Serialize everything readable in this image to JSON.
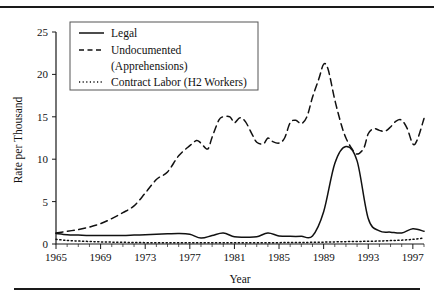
{
  "figure": {
    "has_top_rule": true,
    "has_bottom_rule": true,
    "rule_color": "#1a1a1a",
    "background": "#ffffff"
  },
  "chart_data": {
    "type": "line",
    "title": "",
    "xlabel": "Year",
    "ylabel": "Rate per Thousand",
    "xlim": [
      1965,
      1998
    ],
    "ylim": [
      0,
      25
    ],
    "grid": false,
    "legend_position": "top-left",
    "xticks": [
      1965,
      1969,
      1973,
      1977,
      1981,
      1985,
      1989,
      1993,
      1997
    ],
    "xtick_labels": [
      "1965",
      "1969",
      "1973",
      "1977",
      "1981",
      "1985",
      "1989",
      "1993",
      "1997"
    ],
    "yticks": [
      0,
      5,
      10,
      15,
      20,
      25
    ],
    "ytick_labels": [
      "0",
      "5",
      "10",
      "15",
      "20",
      "25"
    ],
    "x": [
      1965,
      1966,
      1967,
      1968,
      1969,
      1970,
      1971,
      1972,
      1973,
      1974,
      1975,
      1976,
      1977,
      1978,
      1979,
      1980,
      1981,
      1982,
      1983,
      1984,
      1985,
      1986,
      1987,
      1988,
      1989,
      1990,
      1991,
      1992,
      1993,
      1994,
      1995,
      1996,
      1997,
      1998
    ],
    "series": [
      {
        "name": "Legal",
        "style": "solid",
        "color": "#111111",
        "values": [
          1.25,
          1.1,
          1.05,
          1.0,
          1.0,
          1.0,
          1.0,
          1.05,
          1.1,
          1.15,
          1.2,
          1.25,
          1.15,
          0.7,
          1.0,
          1.3,
          0.85,
          0.8,
          0.85,
          1.3,
          0.95,
          0.9,
          0.9,
          0.95,
          3.8,
          9.5,
          11.5,
          9.8,
          3.0,
          1.55,
          1.4,
          1.3,
          1.8,
          1.5
        ]
      },
      {
        "name": "Undocumented (Apprehensions)",
        "style": "dashed",
        "color": "#111111",
        "values": [
          1.3,
          1.5,
          1.7,
          2.0,
          2.4,
          3.0,
          3.6,
          4.6,
          5.9,
          7.0,
          8.3,
          9.5,
          10.8,
          12.2,
          12.1,
          11.3,
          11.8,
          13.5,
          15.0,
          14.9,
          14.4,
          15.0,
          14.2,
          12.0,
          11.8,
          12.1,
          11.6,
          13.0,
          14.5,
          15.0,
          16.0,
          17.8,
          19.5,
          21.2
        ]
      },
      {
        "name": "Contract Labor (H2 Workers)",
        "style": "dotted",
        "color": "#111111",
        "values": [
          0.55,
          0.42,
          0.35,
          0.3,
          0.25,
          0.22,
          0.2,
          0.18,
          0.16,
          0.15,
          0.15,
          0.15,
          0.15,
          0.15,
          0.15,
          0.15,
          0.15,
          0.15,
          0.15,
          0.15,
          0.16,
          0.17,
          0.18,
          0.2,
          0.22,
          0.25,
          0.28,
          0.3,
          0.32,
          0.35,
          0.4,
          0.45,
          0.55,
          0.7
        ]
      }
    ],
    "undocumented_points": [
      [
        1965,
        1.3
      ],
      [
        1966,
        1.5
      ],
      [
        1967,
        1.7
      ],
      [
        1968,
        2.0
      ],
      [
        1969,
        2.4
      ],
      [
        1970,
        3.0
      ],
      [
        1971,
        3.7
      ],
      [
        1972,
        4.5
      ],
      [
        1973,
        6.0
      ],
      [
        1974,
        7.6
      ],
      [
        1975,
        8.5
      ],
      [
        1976,
        10.4
      ],
      [
        1977,
        11.6
      ],
      [
        1977.6,
        12.2
      ],
      [
        1978,
        11.9
      ],
      [
        1978.6,
        11.2
      ],
      [
        1979,
        12.6
      ],
      [
        1979.6,
        14.6
      ],
      [
        1980,
        15.0
      ],
      [
        1980.6,
        15.0
      ],
      [
        1981,
        14.3
      ],
      [
        1981.5,
        14.9
      ],
      [
        1982,
        14.4
      ],
      [
        1982.6,
        12.9
      ],
      [
        1983,
        12.0
      ],
      [
        1983.6,
        11.8
      ],
      [
        1984,
        12.5
      ],
      [
        1984.4,
        12.1
      ],
      [
        1985,
        11.9
      ],
      [
        1985.5,
        12.5
      ],
      [
        1986,
        14.3
      ],
      [
        1986.5,
        14.6
      ],
      [
        1987,
        14.2
      ],
      [
        1987.5,
        15.0
      ],
      [
        1988,
        17.3
      ],
      [
        1988.6,
        19.6
      ],
      [
        1989,
        21.2
      ],
      [
        1989.4,
        20.6
      ],
      [
        1990,
        17.0
      ],
      [
        1990.6,
        14.0
      ],
      [
        1991,
        12.5
      ],
      [
        1991.5,
        11.3
      ],
      [
        1992,
        10.6
      ],
      [
        1992.6,
        11.3
      ],
      [
        1993,
        13.0
      ],
      [
        1993.5,
        13.6
      ],
      [
        1994,
        13.4
      ],
      [
        1994.5,
        13.3
      ],
      [
        1995,
        13.8
      ],
      [
        1995.5,
        14.5
      ],
      [
        1996,
        14.6
      ],
      [
        1996.5,
        13.6
      ],
      [
        1997,
        11.8
      ],
      [
        1997.4,
        12.3
      ],
      [
        1998,
        14.8
      ],
      [
        1998.5,
        16.4
      ],
      [
        1999,
        17.3
      ],
      [
        1999.5,
        16.2
      ],
      [
        2000,
        15.8
      ],
      [
        2000.5,
        17.1
      ]
    ]
  },
  "legend": {
    "entries": [
      {
        "label": "Legal",
        "style": "solid"
      },
      {
        "label": "Undocumented",
        "style": "dashed"
      },
      {
        "label": "(Apprehensions)",
        "style": "none"
      },
      {
        "label": "Contract Labor (H2 Workers)",
        "style": "dotted"
      }
    ]
  }
}
